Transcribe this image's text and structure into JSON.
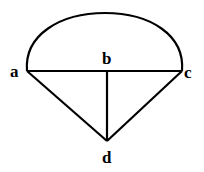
{
  "diagram": {
    "nodes": [
      {
        "id": "a",
        "label": "a",
        "x": 27,
        "y": 71
      },
      {
        "id": "b",
        "label": "b",
        "x": 107,
        "y": 71
      },
      {
        "id": "c",
        "label": "c",
        "x": 182,
        "y": 71
      },
      {
        "id": "d",
        "label": "d",
        "x": 107,
        "y": 141
      }
    ],
    "edges": [
      {
        "from": "a",
        "to": "c",
        "type": "line"
      },
      {
        "from": "b",
        "to": "d",
        "type": "line"
      },
      {
        "from": "a",
        "to": "d",
        "type": "line"
      },
      {
        "from": "c",
        "to": "d",
        "type": "line"
      },
      {
        "from": "a",
        "to": "c",
        "type": "arc"
      }
    ],
    "labels": {
      "a": "a",
      "b": "b",
      "c": "c",
      "d": "d"
    },
    "stroke_color": "#000000"
  }
}
